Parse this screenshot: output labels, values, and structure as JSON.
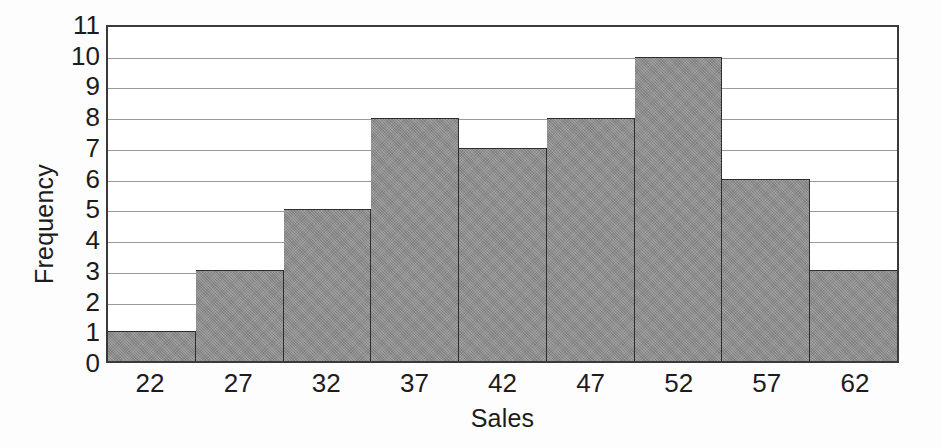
{
  "chart_data": {
    "type": "bar",
    "title": "",
    "subtitle": "",
    "xlabel": "Sales",
    "ylabel": "Frequency",
    "categories": [
      "22",
      "27",
      "32",
      "37",
      "42",
      "47",
      "52",
      "57",
      "62"
    ],
    "values": [
      1,
      3,
      5,
      8,
      7,
      8,
      10,
      6,
      3
    ],
    "series": [
      {
        "name": "Frequency",
        "values": [
          1,
          3,
          5,
          8,
          7,
          8,
          10,
          6,
          3
        ]
      }
    ],
    "ylim": [
      0,
      11
    ],
    "yticks": [
      11,
      10,
      9,
      8,
      7,
      6,
      5,
      4,
      3,
      2,
      1,
      0
    ],
    "ytick_labels": [
      "11",
      "10",
      "9",
      "8",
      "7",
      "6",
      "5",
      "4",
      "3",
      "2",
      "1",
      "0"
    ],
    "xtick_labels": [
      "22",
      "27",
      "32",
      "37",
      "42",
      "47",
      "52",
      "57",
      "62"
    ],
    "grid": true,
    "grid_axis": "y",
    "legend": false,
    "legend_position": "none",
    "bar_fill_color": "#8c8c8c",
    "bar_edge_color": "#2e2e2e",
    "grid_color": "#9a9a9a",
    "axis_color": "#3a3a3a",
    "background_color": "#ffffff",
    "text_color": "#1c1c1c",
    "bin_width": 5,
    "annotations": []
  }
}
